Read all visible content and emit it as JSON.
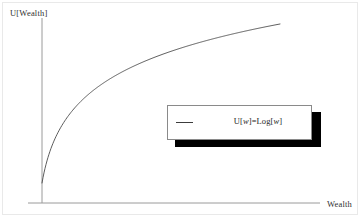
{
  "figure": {
    "width": 362,
    "height": 219,
    "background": "#ffffff",
    "frame_color": "#e9e9e9"
  },
  "axes": {
    "y_label": "U[Wealth]",
    "x_label": "Wealth",
    "axis_color": "#9a9a9a",
    "y_axis": {
      "x": 42,
      "y_top": 18,
      "y_bottom": 203
    },
    "x_axis": {
      "y": 203,
      "x_left": 28,
      "x_right": 320
    }
  },
  "legend": {
    "entry_label": "U[w]=Log[w]",
    "entry_label_prefix": "U[",
    "entry_label_var1": "w",
    "entry_label_middle": "]=Log[",
    "entry_label_var2": "w",
    "entry_label_suffix": "]",
    "line_color": "#3c3c3c",
    "border_color": "#8a8a8a",
    "shadow_color": "#000000",
    "background": "#ffffff"
  },
  "chart_data": {
    "type": "line",
    "title": "",
    "xlabel": "Wealth",
    "ylabel": "U[Wealth]",
    "grid": false,
    "legend_position": "center-right",
    "series": [
      {
        "name": "U[w]=Log[w]",
        "function": "U[w]=Log[w]",
        "color": "#4a4a4a",
        "x": [
          1,
          1.5,
          2,
          3,
          4,
          5,
          6,
          7,
          8,
          9,
          10,
          12,
          14,
          16,
          18,
          20,
          22,
          24,
          26,
          28,
          30
        ],
        "y": [
          0,
          0.405,
          0.693,
          1.099,
          1.386,
          1.609,
          1.792,
          1.946,
          2.079,
          2.197,
          2.303,
          2.485,
          2.639,
          2.773,
          2.89,
          2.996,
          3.091,
          3.178,
          3.258,
          3.332,
          3.401
        ]
      }
    ],
    "xlim": [
      1,
      30
    ],
    "ylim": [
      0,
      3.6
    ],
    "xticks": [],
    "yticks": [],
    "annotations": []
  }
}
